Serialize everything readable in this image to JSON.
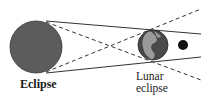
{
  "diagram": {
    "labels": {
      "sun": "Eclipse",
      "lunar_line1": "Lunar",
      "lunar_line2": "eclipse"
    },
    "bodies": [
      {
        "name": "sun",
        "cx": 36,
        "cy": 47,
        "r": 26,
        "color": "#5a5a5a"
      },
      {
        "name": "earth",
        "cx": 153,
        "cy": 45,
        "r": 15,
        "color": "#4a4a4a",
        "land_color": "#9a9a9a"
      },
      {
        "name": "moon",
        "cx": 183,
        "cy": 45,
        "r": 5,
        "color": "#111111"
      }
    ],
    "colors": {
      "line": "#333333",
      "background": "#ffffff"
    }
  }
}
